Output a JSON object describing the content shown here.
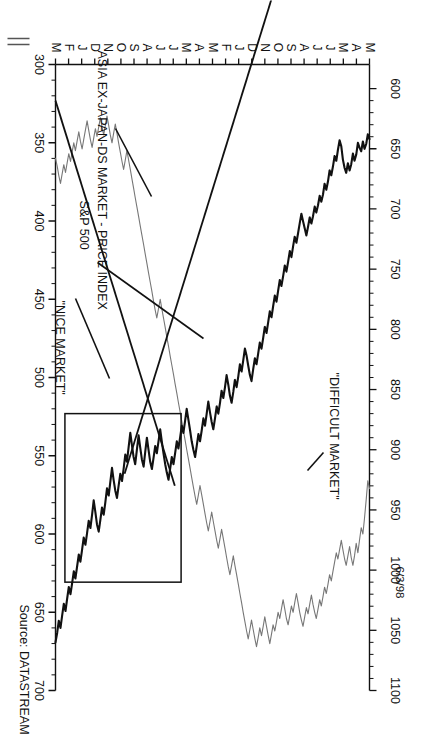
{
  "figure": {
    "date_stamp": "6/3/98",
    "source_note": "Source: DATASTREAM"
  },
  "annotations": {
    "difficult_market": "\"DIFFICULT MARKET\"",
    "nice_market": "\"NICE MARKET\"",
    "asia_label": "ASIA EX-JAPAN-DS MARKET - PRICE INDEX",
    "spx_label": "S&P 500"
  },
  "chart_data": {
    "type": "line",
    "title": "",
    "subtitle": "",
    "xlabel": "",
    "ylabel": "",
    "grid": false,
    "legend_position": "inline-callouts",
    "x_tick_labels": [
      "M",
      "A",
      "M",
      "J",
      "J",
      "A",
      "S",
      "O",
      "N",
      "D",
      "J",
      "F",
      "M",
      "A",
      "M",
      "J",
      "J",
      "A",
      "S",
      "O",
      "N",
      "D",
      "J",
      "F",
      "M"
    ],
    "left_axis": {
      "name": "ASIA EX-JAPAN-DS MARKET - PRICE INDEX",
      "ticks": [
        300,
        350,
        400,
        450,
        500,
        550,
        600,
        650,
        700
      ],
      "lim": [
        300,
        700
      ],
      "minor_per_major": 5
    },
    "right_axis": {
      "name": "S&P 500",
      "ticks": [
        600,
        650,
        700,
        750,
        800,
        850,
        900,
        950,
        1000,
        1050,
        1100
      ],
      "lim": [
        580,
        1100
      ],
      "minor_per_major": 5
    },
    "series": [
      {
        "name": "S&P 500",
        "axis": "right",
        "color": "#111111",
        "style": "bold",
        "values": [
          642,
          638,
          646,
          650,
          644,
          652,
          649,
          645,
          655,
          660,
          654,
          663,
          668,
          662,
          670,
          666,
          659,
          648,
          643,
          651,
          660,
          656,
          665,
          672,
          668,
          677,
          684,
          679,
          688,
          694,
          689,
          697,
          703,
          698,
          706,
          712,
          707,
          715,
          722,
          716,
          710,
          704,
          712,
          720,
          728,
          723,
          731,
          740,
          735,
          744,
          752,
          747,
          756,
          764,
          759,
          768,
          777,
          772,
          781,
          790,
          785,
          794,
          803,
          798,
          807,
          816,
          811,
          820,
          829,
          824,
          833,
          843,
          838,
          830,
          822,
          816,
          826,
          835,
          829,
          839,
          848,
          842,
          852,
          861,
          855,
          846,
          838,
          848,
          857,
          851,
          861,
          870,
          864,
          874,
          883,
          877,
          869,
          860,
          870,
          880,
          874,
          884,
          893,
          887,
          897,
          906,
          900,
          893,
          884,
          875,
          866,
          876,
          886,
          880,
          890,
          899,
          893,
          903,
          912,
          906,
          916,
          925,
          919,
          912,
          903,
          893,
          883,
          893,
          903,
          897,
          907,
          916,
          910,
          900,
          890,
          902,
          914,
          908,
          898,
          888,
          900,
          912,
          906,
          896,
          886,
          898,
          910,
          904,
          916,
          926,
          920,
          930,
          940,
          934,
          925,
          915,
          927,
          938,
          932,
          944,
          954,
          948,
          958,
          968,
          962,
          952,
          942,
          954,
          965,
          959,
          969,
          979,
          973,
          983,
          993,
          987,
          997,
          1007,
          1001,
          1011,
          1020,
          1014,
          1024,
          1034,
          1028,
          1038,
          1048,
          1042,
          1052,
          1060
        ]
      },
      {
        "name": "ASIA EX-JAPAN-DS MARKET - PRICE INDEX",
        "axis": "left",
        "color": "#777777",
        "style": "thin",
        "values": [
          571,
          566,
          578,
          590,
          600,
          596,
          604,
          612,
          606,
          614,
          620,
          615,
          608,
          614,
          620,
          616,
          610,
          604,
          610,
          616,
          612,
          618,
          624,
          630,
          626,
          632,
          638,
          634,
          640,
          646,
          642,
          648,
          654,
          650,
          645,
          639,
          645,
          651,
          647,
          653,
          659,
          655,
          650,
          644,
          638,
          644,
          650,
          646,
          652,
          658,
          654,
          648,
          642,
          648,
          654,
          650,
          656,
          662,
          658,
          664,
          670,
          665,
          659,
          653,
          659,
          665,
          660,
          666,
          672,
          667,
          661,
          655,
          661,
          667,
          662,
          656,
          650,
          644,
          638,
          632,
          626,
          620,
          614,
          620,
          626,
          621,
          615,
          609,
          603,
          597,
          603,
          609,
          604,
          598,
          592,
          586,
          592,
          598,
          593,
          587,
          581,
          575,
          569,
          575,
          581,
          576,
          570,
          564,
          558,
          552,
          546,
          540,
          534,
          528,
          522,
          516,
          510,
          504,
          498,
          492,
          486,
          480,
          474,
          468,
          462,
          456,
          450,
          456,
          462,
          457,
          451,
          445,
          439,
          433,
          427,
          421,
          415,
          409,
          403,
          397,
          391,
          385,
          379,
          373,
          367,
          361,
          355,
          361,
          367,
          362,
          356,
          350,
          344,
          338,
          344,
          350,
          345,
          339,
          333,
          339,
          345,
          340,
          334,
          340,
          346,
          341,
          347,
          353,
          348,
          342,
          336,
          342,
          348,
          354,
          349,
          343,
          349,
          355,
          350,
          356,
          362,
          357,
          363,
          369,
          364,
          370,
          376,
          371,
          365,
          360
        ]
      }
    ],
    "trend_lines": [
      {
        "name": "nice-market-uptrend",
        "from": {
          "x": 0.08,
          "y": 330
        },
        "to": {
          "x": 0.78,
          "y": 920
        }
      },
      {
        "name": "difficult-market-downtrend",
        "from": {
          "x": 0.62,
          "y": 930
        },
        "to": {
          "x": 1.0,
          "y": 610
        }
      }
    ],
    "boxes": [
      {
        "name": "difficult-market-box",
        "x0": 0.6,
        "x1": 0.97,
        "y0_right": 870,
        "y1_right": 1010
      }
    ]
  }
}
